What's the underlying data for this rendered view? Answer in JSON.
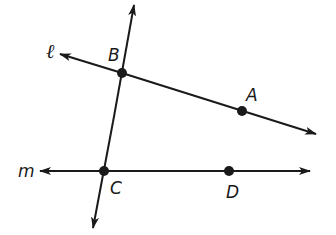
{
  "diagram": {
    "type": "geometry-lines",
    "lines": [
      {
        "name": "ℓ",
        "through": [
          "B",
          "A"
        ]
      },
      {
        "name": "m",
        "through": [
          "C",
          "D"
        ]
      },
      {
        "name": "transversal",
        "through": [
          "B",
          "C"
        ]
      }
    ],
    "points": [
      {
        "label": "A",
        "x": 242,
        "y": 111
      },
      {
        "label": "B",
        "x": 122,
        "y": 73
      },
      {
        "label": "C",
        "x": 104,
        "y": 171
      },
      {
        "label": "D",
        "x": 229,
        "y": 171
      }
    ],
    "line_labels": {
      "l": "ℓ",
      "m": "m"
    },
    "colors": {
      "stroke": "#1a1a1a",
      "background": "#ffffff"
    }
  }
}
